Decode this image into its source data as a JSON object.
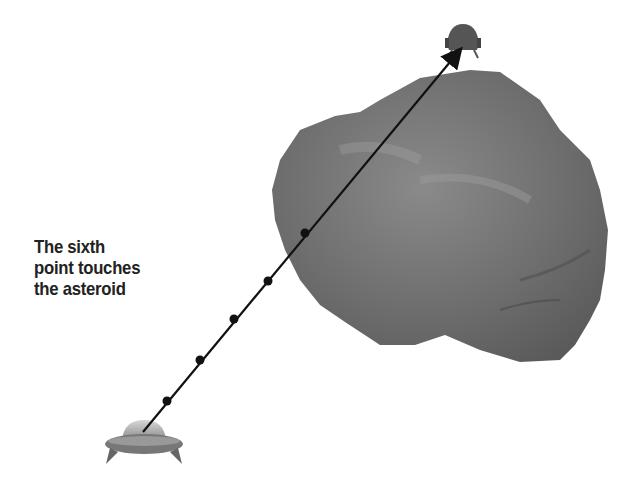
{
  "caption": {
    "lines": [
      "The sixth",
      "point touches",
      "the asteroid"
    ]
  },
  "diagram": {
    "start": {
      "label": "player-ship",
      "x": 143,
      "y": 432
    },
    "end": {
      "label": "enemy-ship",
      "x": 462,
      "y": 48
    },
    "points": [
      {
        "x": 167,
        "y": 401
      },
      {
        "x": 200,
        "y": 360
      },
      {
        "x": 234,
        "y": 319
      },
      {
        "x": 268,
        "y": 281
      },
      {
        "x": 305,
        "y": 233
      }
    ],
    "colors": {
      "line": "#111111",
      "asteroid": "#6f6f6f",
      "ship": "#888888"
    }
  }
}
